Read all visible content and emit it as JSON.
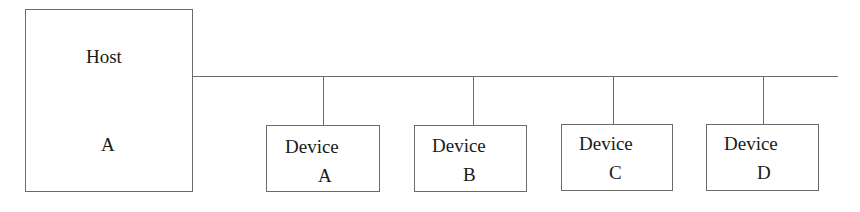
{
  "diagram": {
    "type": "bus-topology",
    "host": {
      "line1": "Host",
      "line2": "A"
    },
    "devices": [
      {
        "line1": "Device",
        "line2": "A"
      },
      {
        "line1": "Device",
        "line2": "B"
      },
      {
        "line1": "Device",
        "line2": "C"
      },
      {
        "line1": "Device",
        "line2": "D"
      }
    ],
    "colors": {
      "stroke": "#6b6b6b",
      "text": "#1a1a1a",
      "background": "#ffffff"
    }
  }
}
